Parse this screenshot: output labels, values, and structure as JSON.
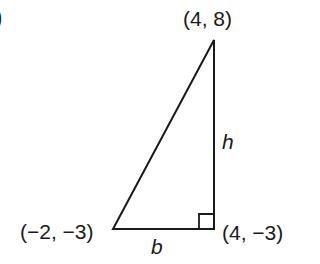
{
  "figure": {
    "partial_label": ")",
    "triangle": {
      "vertices": [
        {
          "name": "top",
          "label": "(4, 8)",
          "x": 4,
          "y": 8
        },
        {
          "name": "bottom-left",
          "label": "(−2, −3)",
          "x": -2,
          "y": -3
        },
        {
          "name": "bottom-right",
          "label": "(4, −3)",
          "x": 4,
          "y": -3
        }
      ],
      "sides": {
        "base": "b",
        "height": "h"
      },
      "right_angle_at": "bottom-right"
    },
    "stroke_color": "#1a1a1a",
    "background": "#ffffff"
  }
}
